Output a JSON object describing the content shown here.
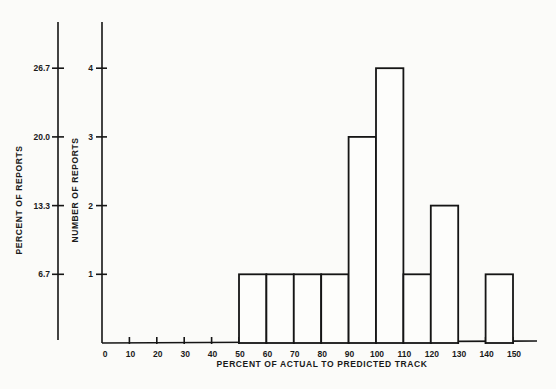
{
  "chart_data": {
    "type": "bar",
    "subtype": "histogram",
    "title": "",
    "xlabel": "PERCENT OF ACTUAL TO PREDICTED TRACK",
    "ylabel": "NUMBER OF REPORTS",
    "ylabel_secondary": "PERCENT OF REPORTS",
    "x_ticks": [
      0,
      10,
      20,
      30,
      40,
      50,
      60,
      70,
      80,
      90,
      100,
      110,
      120,
      130,
      140,
      150
    ],
    "y_ticks": [
      1,
      2,
      3,
      4
    ],
    "y_ticks_secondary": [
      "6.7",
      "13.3",
      "20.0",
      "26.7"
    ],
    "xlim": [
      0,
      150
    ],
    "ylim": [
      0,
      4.6
    ],
    "grid": false,
    "legend": null,
    "bins": [
      {
        "from": 50,
        "to": 60,
        "count": 1
      },
      {
        "from": 60,
        "to": 70,
        "count": 1
      },
      {
        "from": 70,
        "to": 80,
        "count": 1
      },
      {
        "from": 80,
        "to": 90,
        "count": 1
      },
      {
        "from": 90,
        "to": 100,
        "count": 3
      },
      {
        "from": 100,
        "to": 110,
        "count": 4
      },
      {
        "from": 110,
        "to": 120,
        "count": 1
      },
      {
        "from": 120,
        "to": 130,
        "count": 2
      },
      {
        "from": 130,
        "to": 140,
        "count": 0
      },
      {
        "from": 140,
        "to": 150,
        "count": 1
      }
    ],
    "categories": [
      "50-60",
      "60-70",
      "70-80",
      "80-90",
      "90-100",
      "100-110",
      "110-120",
      "120-130",
      "130-140",
      "140-150"
    ],
    "values": [
      1,
      1,
      1,
      1,
      3,
      4,
      1,
      2,
      0,
      1
    ],
    "percent_values": [
      6.7,
      6.7,
      6.7,
      6.7,
      20.0,
      26.7,
      6.7,
      13.3,
      0,
      6.7
    ]
  }
}
